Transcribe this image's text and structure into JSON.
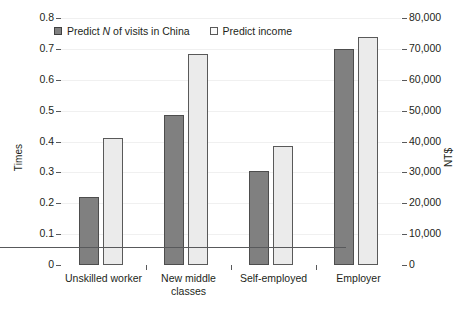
{
  "chart_data": {
    "type": "bar",
    "title": "",
    "subtitle": "",
    "categories": [
      "Unskilled worker",
      "New middle classes",
      "Self-employed",
      "Employer"
    ],
    "series": [
      {
        "name": "Predict N of visits in China",
        "axis": "left",
        "color": "#808080",
        "values": [
          0.22,
          0.485,
          0.305,
          0.7
        ]
      },
      {
        "name": "Predict income",
        "axis": "right",
        "color": "#ebebeb",
        "values": [
          0.41,
          0.685,
          0.385,
          0.74
        ]
      }
    ],
    "xlabel": "",
    "ylabel": "Times",
    "y2label": "NT$",
    "ylim": [
      0,
      0.8
    ],
    "y2lim": [
      0,
      80000
    ],
    "ytick_labels": [
      "0",
      "0.1",
      "0.2",
      "0.3",
      "0.4",
      "0.5",
      "0.6",
      "0.7",
      "0.8"
    ],
    "ytick_values": [
      0,
      0.1,
      0.2,
      0.3,
      0.4,
      0.5,
      0.6,
      0.7,
      0.8
    ],
    "y2tick_labels": [
      "0",
      "10,000",
      "20,000",
      "30,000",
      "40,000",
      "50,000",
      "60,000",
      "70,000",
      "80,000"
    ],
    "y2tick_values": [
      0,
      10000,
      20000,
      30000,
      40000,
      50000,
      60000,
      70000,
      80000
    ],
    "grid": true,
    "legend_position": "top-left"
  },
  "axes": {
    "left_title": "Times",
    "right_title": "NT$"
  },
  "legend": {
    "items": [
      {
        "label_prefix": "Predict ",
        "label_italic": "N",
        "label_suffix": " of visits in China",
        "swatch": "filled-gray-square"
      },
      {
        "label_prefix": "Predict income",
        "label_italic": "",
        "label_suffix": "",
        "swatch": "open-light-square"
      }
    ]
  }
}
